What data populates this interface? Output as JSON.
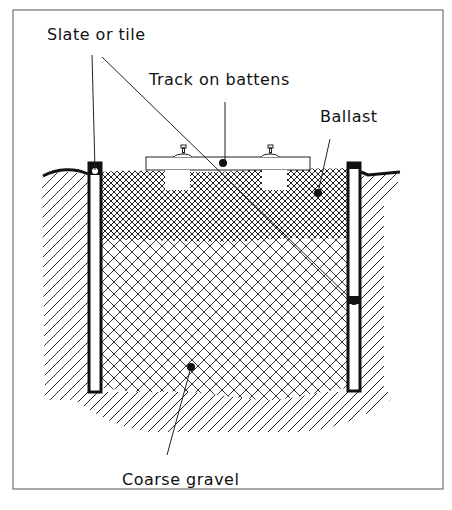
{
  "diagram": {
    "type": "cross-section",
    "labels": {
      "slate": "Slate or tile",
      "track": "Track on battens",
      "ballast": "Ballast",
      "gravel": "Coarse gravel"
    },
    "colors": {
      "ink": "#111111",
      "background": "#ffffff",
      "frame": "#555555"
    },
    "layers": [
      {
        "name": "Ballast",
        "pattern": "fine cross-hatch"
      },
      {
        "name": "Coarse gravel",
        "pattern": "coarse cross-hatch"
      },
      {
        "name": "Ground",
        "pattern": "diagonal hatch"
      }
    ]
  }
}
